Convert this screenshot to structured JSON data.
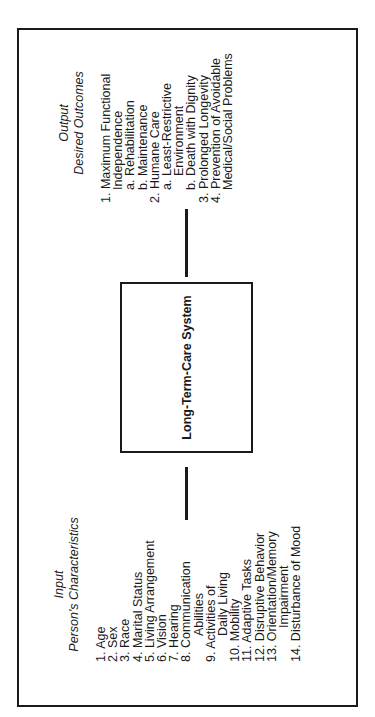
{
  "diagram": {
    "orientation": "rotated -90deg (text reads bottom-to-top)",
    "input": {
      "title": "Input",
      "subtitle": "Person's Characteristics",
      "items": [
        {
          "num": "1.",
          "text": "Age"
        },
        {
          "num": "2.",
          "text": "Sex"
        },
        {
          "num": "3.",
          "text": "Race"
        },
        {
          "num": "4.",
          "text": "Marital Status"
        },
        {
          "num": "5.",
          "text": "Living Arrangement"
        },
        {
          "num": "6.",
          "text": "Vision"
        },
        {
          "num": "7.",
          "text": "Hearing"
        },
        {
          "num": "8.",
          "text": "Communication",
          "cont": "Abilities"
        },
        {
          "num": "9.",
          "text": "Activities of",
          "cont": "Daily Living"
        },
        {
          "num": "10.",
          "text": "Mobility"
        },
        {
          "num": "11.",
          "text": "Adaptive Tasks"
        },
        {
          "num": "12.",
          "text": "Disruptive Behavior"
        },
        {
          "num": "13.",
          "text": "Orientation/Memory",
          "cont": "Impairment"
        },
        {
          "num": "14.",
          "text": "Disturbance of Mood"
        }
      ]
    },
    "system": {
      "label": "Long-Term-Care System"
    },
    "output": {
      "title": "Output",
      "subtitle": "Desired Outcomes",
      "items": [
        {
          "num": "1.",
          "text": "Maximum Functional",
          "cont": "Independence"
        },
        {
          "num": "a.",
          "text": "Rehabilitation",
          "level": "sub"
        },
        {
          "num": "b.",
          "text": "Maintenance",
          "level": "sub"
        },
        {
          "num": "2.",
          "text": "Humane Care"
        },
        {
          "num": "a.",
          "text": "Least-Restrictive",
          "cont": "Environment",
          "level": "sub"
        },
        {
          "num": "b.",
          "text": "Death with Dignity",
          "level": "sub"
        },
        {
          "num": "3.",
          "text": "Prolonged Longevity"
        },
        {
          "num": "4.",
          "text": "Prevention of Avoidable",
          "cont": "Medical/Social Problems"
        }
      ]
    }
  }
}
